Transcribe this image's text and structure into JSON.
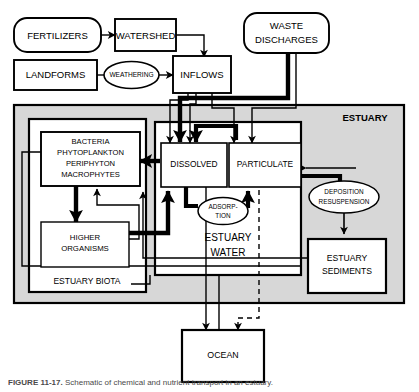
{
  "figure": {
    "caption_label": "FIGURE 11-17.",
    "caption_text": " Schematic of chemical and nutrient transport in an estuary.",
    "background_color": "#ffffff",
    "ink_color": "#000000",
    "estuary_fill": "#d9d9d9",
    "box_fill": "#ffffff"
  },
  "nodes": {
    "fertilizers": {
      "label": "FERTILIZERS",
      "shape": "rounded-rect"
    },
    "watershed": {
      "label": "WATERSHED",
      "shape": "rect"
    },
    "landforms": {
      "label": "LANDFORMS",
      "shape": "rect"
    },
    "weathering": {
      "label": "WEATHERING",
      "shape": "ellipse"
    },
    "inflows": {
      "label": "INFLOWS",
      "shape": "rect"
    },
    "waste_discharges": {
      "label_line1": "WASTE",
      "label_line2": "DISCHARGES",
      "shape": "rounded-rect"
    },
    "estuary": {
      "label": "ESTUARY",
      "shape": "container"
    },
    "estuary_biota": {
      "label": "ESTUARY BIOTA",
      "shape": "container"
    },
    "primary_producers": {
      "line1": "BACTERIA",
      "line2": "PHYTOPLANKTON",
      "line3": "PERIPHYTON",
      "line4": "MACROPHYTES",
      "shape": "rect"
    },
    "higher_organisms": {
      "line1": "HIGHER",
      "line2": "ORGANISMS",
      "shape": "rect"
    },
    "estuary_water": {
      "line1": "ESTUARY",
      "line2": "WATER",
      "shape": "container"
    },
    "dissolved": {
      "label": "DISSOLVED",
      "shape": "rect"
    },
    "particulate": {
      "label": "PARTICULATE",
      "shape": "rect"
    },
    "adsorption": {
      "line1": "ADSORP-",
      "line2": "TION",
      "shape": "ellipse"
    },
    "deposition_resuspension": {
      "line1": "DEPOSITION",
      "line2": "RESUSPENSION",
      "shape": "ellipse"
    },
    "estuary_sediments": {
      "line1": "ESTUARY",
      "line2": "SEDIMENTS",
      "shape": "rect"
    },
    "ocean": {
      "label": "OCEAN",
      "shape": "rect"
    }
  },
  "edges": [
    {
      "from": "fertilizers",
      "to": "watershed",
      "style": "thin"
    },
    {
      "from": "landforms",
      "to": "weathering",
      "style": "thin-no-arrow"
    },
    {
      "from": "weathering",
      "to": "inflows",
      "style": "thin"
    },
    {
      "from": "watershed",
      "to": "inflows",
      "style": "thin"
    },
    {
      "from": "waste_discharges",
      "to": "dissolved",
      "style": "thick"
    },
    {
      "from": "waste_discharges",
      "to": "particulate",
      "style": "thin"
    },
    {
      "from": "inflows",
      "to": "dissolved",
      "style": "thin"
    },
    {
      "from": "inflows",
      "to": "particulate",
      "style": "thin"
    },
    {
      "from": "dissolved",
      "to": "primary_producers",
      "style": "thick"
    },
    {
      "from": "primary_producers",
      "to": "higher_organisms",
      "style": "thick"
    },
    {
      "from": "higher_organisms",
      "to": "dissolved",
      "style": "thick"
    },
    {
      "from": "higher_organisms",
      "to": "primary_producers",
      "style": "thin"
    },
    {
      "from": "dissolved",
      "to": "particulate",
      "style": "thick-adsorption"
    },
    {
      "from": "particulate",
      "to": "dissolved",
      "style": "thick-adsorption"
    },
    {
      "from": "particulate",
      "to": "deposition_resuspension",
      "style": "thick"
    },
    {
      "from": "deposition_resuspension",
      "to": "estuary_sediments",
      "style": "thin"
    },
    {
      "from": "estuary_sediments",
      "to": "dissolved",
      "style": "thin"
    },
    {
      "from": "estuary_water",
      "to": "ocean",
      "style": "thin"
    },
    {
      "from": "estuary_sediments",
      "to": "ocean",
      "style": "dashed"
    }
  ]
}
